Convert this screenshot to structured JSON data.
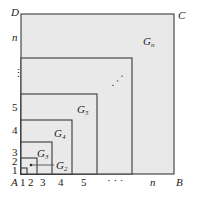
{
  "diagram": {
    "corners": {
      "A": "A",
      "B": "B",
      "C": "C",
      "D": "D"
    },
    "squares": [
      {
        "name": "G1",
        "right": 27,
        "top": 168
      },
      {
        "name": "G2",
        "right": 37,
        "top": 158
      },
      {
        "name": "G3",
        "right": 52,
        "top": 142
      },
      {
        "name": "G4",
        "right": 72,
        "top": 120
      },
      {
        "name": "G5",
        "right": 97,
        "top": 94
      },
      {
        "name": "G(n-1)",
        "right": 132,
        "top": 58
      },
      {
        "name": "Gn",
        "right": 174,
        "top": 14
      }
    ],
    "origin": {
      "x": 21,
      "y": 174
    },
    "region_labels": {
      "g_letter": "G",
      "g2_sub": "2",
      "g3_sub": "3",
      "g4_sub": "4",
      "g5_sub": "5",
      "gn_sub": "n"
    },
    "x_axis_labels": [
      "1",
      "2",
      "3",
      "4",
      "5",
      "· · ·",
      "n"
    ],
    "y_axis_labels": [
      "1",
      "2",
      "3",
      "4",
      "5",
      "⋮",
      "n"
    ],
    "diagonal_dots": "· · ·",
    "colors": {
      "fill": "#e9e9e9",
      "stroke": "#3a3a3a",
      "text": "#222222"
    }
  }
}
